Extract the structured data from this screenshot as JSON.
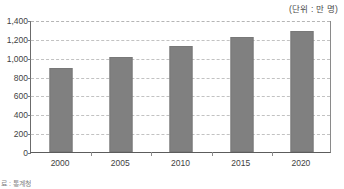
{
  "unit_caption": "(단위 : 만 명)",
  "source_note": "료 : 통계청",
  "colors": {
    "bar_fill": "#808080",
    "gridline": "#c2c2c2",
    "axis": "#5c5c5c",
    "text": "#3f3f3f"
  },
  "chart_data": {
    "type": "bar",
    "title": "",
    "subtitle": "",
    "xlabel": "",
    "ylabel": "",
    "unit": "만 명",
    "categories": [
      "2000",
      "2005",
      "2010",
      "2015",
      "2020"
    ],
    "values": [
      890,
      1010,
      1125,
      1215,
      1280
    ],
    "series": [
      {
        "name": "",
        "values": [
          890,
          1010,
          1125,
          1215,
          1280
        ]
      }
    ],
    "ylim": [
      0,
      1400
    ],
    "ytick_values": [
      0,
      200,
      400,
      600,
      800,
      1000,
      1200,
      1400
    ],
    "ytick_labels": [
      "0",
      "200",
      "400",
      "600",
      "800",
      "1,000",
      "1,200",
      "1,400"
    ],
    "grid": true,
    "grid_orientation": "horizontal",
    "grid_style": "dashed",
    "legend": false,
    "legend_position": "none",
    "annotations": [
      "(단위 : 만 명)"
    ]
  }
}
